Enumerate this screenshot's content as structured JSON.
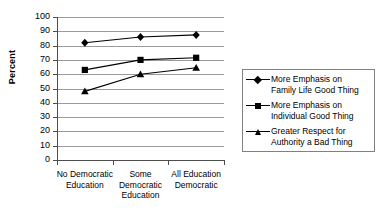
{
  "chart_data": {
    "type": "line",
    "title": "",
    "xlabel": "",
    "ylabel": "Percent",
    "ylim": [
      0,
      100
    ],
    "ytick_step": 10,
    "yticks": [
      100,
      90,
      80,
      70,
      60,
      50,
      40,
      30,
      20,
      10,
      0
    ],
    "grid": true,
    "legend_position": "right",
    "categories": [
      "No Democratic Education",
      "Some Democratic Education",
      "All Education Democratic"
    ],
    "series": [
      {
        "name": "More Emphasis on Family Life Good Thing",
        "marker": "diamond",
        "values": [
          82,
          86,
          87.5
        ]
      },
      {
        "name": "More Emphasis on Individual Good Thing",
        "marker": "square",
        "values": [
          63,
          70,
          71.5
        ]
      },
      {
        "name": "Greater Respect for Authority a Bad Thing",
        "marker": "triangle",
        "values": [
          48,
          60,
          64.5
        ]
      }
    ]
  },
  "axis": {
    "y_title": "Percent",
    "y_tick_labels": [
      "100",
      "90",
      "80",
      "70",
      "60",
      "50",
      "40",
      "30",
      "20",
      "10",
      "0"
    ],
    "x_tick_labels": [
      "No Democratic\nEducation",
      "Some\nDemocratic\nEducation",
      "All Education\nDemocratic"
    ]
  },
  "legend": {
    "entries": [
      {
        "label": "More Emphasis on\nFamily Life Good Thing",
        "marker": "diamond"
      },
      {
        "label": "More Emphasis on\nIndividual Good Thing",
        "marker": "square"
      },
      {
        "label": "Greater Respect for\nAuthority a Bad Thing",
        "marker": "triangle"
      }
    ]
  },
  "colors": {
    "series": "#000000",
    "grid": "#9a9a9a",
    "axis": "#4d4d4d",
    "background": "#ffffff",
    "legend_border": "#808080"
  }
}
